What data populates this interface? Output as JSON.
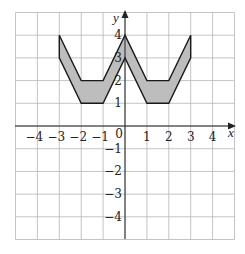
{
  "chart_data": {
    "type": "area",
    "title": "",
    "xlabel": "x",
    "ylabel": "y",
    "xlim": [
      -5,
      5
    ],
    "ylim": [
      -5,
      5
    ],
    "grid": true,
    "x_ticks": [
      -4,
      -3,
      -2,
      -1,
      0,
      1,
      2,
      3,
      4
    ],
    "y_ticks": [
      -4,
      -3,
      -2,
      -1,
      1,
      2,
      3,
      4
    ],
    "origin_label": "0",
    "shape": {
      "name": "W-shaped band",
      "fill": "#bdbdbd",
      "stroke": "#1a1a1a",
      "upper_boundary": [
        [
          -3,
          4
        ],
        [
          -2,
          2
        ],
        [
          -1,
          2
        ],
        [
          0,
          4
        ],
        [
          1,
          2
        ],
        [
          2,
          2
        ],
        [
          3,
          4
        ]
      ],
      "lower_boundary": [
        [
          -3,
          3
        ],
        [
          -2,
          1
        ],
        [
          -1,
          1
        ],
        [
          0,
          3
        ],
        [
          1,
          1
        ],
        [
          2,
          1
        ],
        [
          3,
          3
        ]
      ]
    }
  },
  "labels": {
    "x_axis": "x",
    "y_axis": "y",
    "origin": "0",
    "x_ticks": [
      "−4",
      "−3",
      "−2",
      "−1",
      "1",
      "2",
      "3",
      "4"
    ],
    "y_ticks": [
      "4",
      "3",
      "2",
      "1",
      "−1",
      "−2",
      "−3",
      "−4"
    ]
  }
}
